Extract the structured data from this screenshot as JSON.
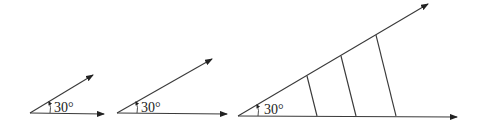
{
  "diagram": {
    "figures": [
      {
        "id": "angle-1",
        "angle_label": "30°",
        "origin": [
          30,
          113
        ],
        "ray_tip": [
          93,
          75
        ],
        "base_tip": [
          104,
          114
        ],
        "label_pos": [
          54,
          112
        ],
        "arc": {
          "from": [
            50,
            113
          ],
          "to": [
            49,
            102
          ]
        },
        "transversals": []
      },
      {
        "id": "angle-2",
        "angle_label": "30°",
        "origin": [
          117,
          113
        ],
        "ray_tip": [
          212,
          59
        ],
        "base_tip": [
          227,
          114
        ],
        "label_pos": [
          141,
          112
        ],
        "arc": {
          "from": [
            137,
            113
          ],
          "to": [
            136,
            102
          ]
        },
        "transversals": []
      },
      {
        "id": "angle-3",
        "angle_label": "30°",
        "origin": [
          238,
          116
        ],
        "ray_tip": [
          428,
          4
        ],
        "base_tip": [
          457,
          117
        ],
        "label_pos": [
          264,
          114
        ],
        "arc": {
          "from": [
            258,
            116
          ],
          "to": [
            257,
            105
          ]
        },
        "transversals": [
          {
            "top": [
              307,
              76
            ],
            "bottom": [
              317,
              116
            ]
          },
          {
            "top": [
              341,
              56
            ],
            "bottom": [
              356,
              116
            ]
          },
          {
            "top": [
              376,
              35
            ],
            "bottom": [
              396,
              116
            ]
          }
        ]
      }
    ],
    "colors": {
      "stroke": "#3a3a3a",
      "text": "#222222",
      "background": "#ffffff"
    }
  }
}
